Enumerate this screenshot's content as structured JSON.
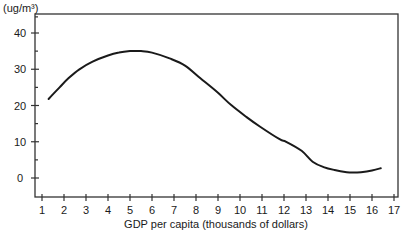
{
  "chart_data": {
    "type": "line",
    "title": "",
    "xlabel": "GDP per capita (thousands of dollars)",
    "ylabel": "(ug/m³)",
    "xlim": [
      1,
      17
    ],
    "ylim": [
      -5,
      45
    ],
    "grid": false,
    "legend": null,
    "x_ticks": [
      1,
      2,
      3,
      4,
      5,
      6,
      7,
      8,
      9,
      10,
      11,
      12,
      13,
      14,
      15,
      16,
      17
    ],
    "y_tick_labels": [
      0,
      10,
      20,
      30,
      40
    ],
    "y_minor_ticks": [
      5,
      15,
      25,
      35
    ],
    "series": [
      {
        "name": "Concentration",
        "x": [
          1.3,
          1.8,
          2.2,
          2.7,
          3.3,
          4.0,
          4.5,
          5.0,
          5.5,
          6.0,
          6.8,
          7.5,
          8.2,
          9.0,
          9.6,
          10.3,
          10.9,
          11.8,
          12.1,
          12.8,
          13.3,
          13.8,
          14.3,
          14.85,
          15.1,
          15.5,
          16.0,
          16.4
        ],
        "values": [
          21.8,
          25.0,
          27.5,
          30.0,
          32.1,
          33.8,
          34.6,
          35.0,
          35.0,
          34.6,
          33.0,
          31.0,
          27.5,
          23.5,
          20.1,
          16.8,
          14.2,
          10.7,
          10.0,
          7.5,
          4.5,
          3.0,
          2.2,
          1.6,
          1.5,
          1.6,
          2.1,
          2.7
        ]
      }
    ]
  },
  "labels": {
    "y_unit": "(ug/m³)",
    "x_title": "GDP per capita (thousands of dollars)"
  },
  "colors": {
    "line": "#1a1a1a",
    "axis": "#333333",
    "background": "#ffffff"
  }
}
